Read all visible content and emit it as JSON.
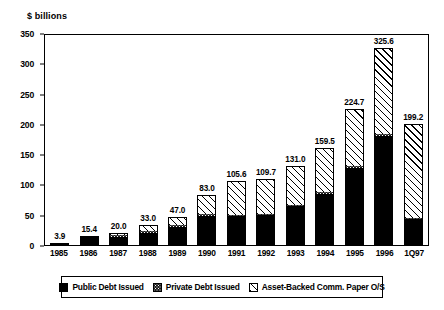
{
  "chart_data": {
    "type": "bar",
    "title": "",
    "subtitle": "",
    "xlabel": "",
    "ylabel": "$ billions",
    "ylim": [
      0,
      350
    ],
    "yticks": [
      0,
      50,
      100,
      150,
      200,
      250,
      300,
      350
    ],
    "grid": false,
    "stacked": true,
    "legend_position": "bottom",
    "categories": [
      "1985",
      "1986",
      "1987",
      "1988",
      "1989",
      "1990",
      "1991",
      "1992",
      "1993",
      "1994",
      "1995",
      "1996",
      "1Q97"
    ],
    "totals": [
      3.9,
      15.4,
      20.0,
      33.0,
      47.0,
      83.0,
      105.6,
      109.7,
      131.0,
      159.5,
      224.7,
      325.6,
      199.2
    ],
    "total_labels": [
      "3.9",
      "15.4",
      "20.0",
      "33.0",
      "47.0",
      "83.0",
      "105.6",
      "109.7",
      "131.0",
      "159.5",
      "224.7",
      "325.6",
      "199.2"
    ],
    "series": [
      {
        "name": "Public Debt Issued",
        "pattern": "solid-black",
        "color": "#000000",
        "values": [
          3.4,
          14.0,
          14.5,
          21.0,
          30.0,
          49.0,
          48.0,
          50.0,
          64.0,
          85.0,
          128.0,
          180.0,
          42.0
        ]
      },
      {
        "name": "Private Debt Issued",
        "pattern": "dense-stipple",
        "color": "#1a1a1a",
        "values": [
          0.5,
          1.4,
          2.5,
          2.0,
          3.0,
          2.0,
          1.6,
          1.7,
          2.0,
          2.5,
          2.7,
          3.6,
          1.2
        ]
      },
      {
        "name": "Asset-Backed Comm. Paper O/S",
        "pattern": "diagonal-hatch",
        "color": "#ffffff",
        "values": [
          0.0,
          0.0,
          3.0,
          10.0,
          14.0,
          32.0,
          56.0,
          58.0,
          65.0,
          72.0,
          94.0,
          142.0,
          156.0
        ]
      }
    ]
  },
  "legend": {
    "items": [
      {
        "label": "Public Debt Issued",
        "swatch": "solid-black-swatch"
      },
      {
        "label": "Private Debt Issued",
        "swatch": "stipple-swatch"
      },
      {
        "label": "Asset-Backed Comm. Paper O/S",
        "swatch": "hatch-swatch"
      }
    ]
  }
}
